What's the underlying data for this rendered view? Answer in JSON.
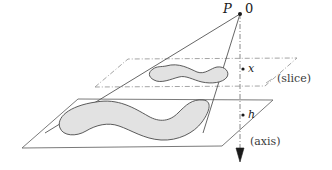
{
  "figure": {
    "type": "geometric-diagram",
    "width": 332,
    "height": 170,
    "background_color": "#ffffff",
    "labels": {
      "apex_point": "P",
      "apex_coordinate": "0",
      "slice_height": "x",
      "base_height": "h",
      "slice_plane": "(slice)",
      "axis": "(axis)"
    },
    "colors": {
      "ink": "#1a1a1a",
      "line": "#555555",
      "plane_edge": "#6b6b6b",
      "dashed_edge": "#8a8a8a",
      "blob_fill": "#e2e2e2",
      "blob_stroke": "#4a4a4a",
      "axis": "#7a7a7a"
    },
    "elements": {
      "apex_dot": "apex-point-dot",
      "slice_dot": "slice-axis-dot",
      "base_dot": "base-axis-dot",
      "axis_arrow": "axis-arrowhead",
      "cone_edge_left": "cone-generator-left",
      "cone_edge_right": "cone-generator-right",
      "slice_plane_outline": "slice-plane-parallelogram",
      "base_plane_outline": "base-plane-parallelogram",
      "slice_region": "slice-cross-section-blob",
      "base_region": "base-region-blob"
    }
  }
}
